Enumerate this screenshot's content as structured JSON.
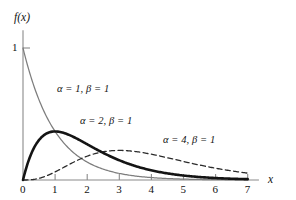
{
  "chart_data": {
    "type": "line",
    "title": "",
    "xlabel": "x",
    "ylabel": "f(x)",
    "xlim": [
      0,
      7.35
    ],
    "ylim": [
      0,
      1.12
    ],
    "xticks": [
      0,
      1,
      2,
      3,
      4,
      5,
      6,
      7
    ],
    "xtick_labels": [
      "0",
      "1",
      "2",
      "3",
      "4",
      "5",
      "6",
      "7"
    ],
    "yticks": [
      1
    ],
    "ytick_labels": [
      "1"
    ],
    "grid": false,
    "legend_position": "inline-annotations",
    "series": [
      {
        "name": "alpha = 1, beta = 1",
        "alpha": 1,
        "beta": 1,
        "style": "solid-gray",
        "color": "#7d7d7d",
        "x": [
          0,
          0.25,
          0.5,
          0.75,
          1,
          1.5,
          2,
          2.5,
          3,
          3.5,
          4,
          4.5,
          5,
          5.5,
          6,
          6.5,
          7
        ],
        "values": [
          1,
          0.779,
          0.607,
          0.472,
          0.368,
          0.223,
          0.135,
          0.082,
          0.05,
          0.03,
          0.018,
          0.011,
          0.007,
          0.004,
          0.002,
          0.002,
          0.001
        ]
      },
      {
        "name": "alpha = 2, beta = 1",
        "alpha": 2,
        "beta": 1,
        "style": "solid-thick-black",
        "color": "#141414",
        "x": [
          0,
          0.25,
          0.5,
          0.75,
          1,
          1.5,
          2,
          2.5,
          3,
          3.5,
          4,
          4.5,
          5,
          5.5,
          6,
          6.5,
          7
        ],
        "values": [
          0,
          0.195,
          0.303,
          0.354,
          0.368,
          0.335,
          0.271,
          0.205,
          0.149,
          0.106,
          0.073,
          0.05,
          0.034,
          0.022,
          0.015,
          0.01,
          0.006
        ]
      },
      {
        "name": "alpha = 4, beta = 1",
        "alpha": 4,
        "beta": 1,
        "style": "dashed",
        "color": "#2b2b2b",
        "x": [
          0,
          0.5,
          1,
          1.5,
          2,
          2.5,
          3,
          3.5,
          4,
          4.5,
          5,
          5.5,
          6,
          6.5,
          7
        ],
        "values": [
          0,
          0.0126,
          0.0613,
          0.1255,
          0.1804,
          0.2138,
          0.224,
          0.2158,
          0.1954,
          0.1687,
          0.1404,
          0.1133,
          0.0892,
          0.0688,
          0.0521
        ]
      }
    ],
    "annotations": [
      {
        "text": "α = 1, β = 1",
        "x_px": 57,
        "y_px": 84
      },
      {
        "text": "α = 2, β = 1",
        "x_px": 80,
        "y_px": 116
      },
      {
        "text": "α = 4, β = 1",
        "x_px": 163,
        "y_px": 135
      }
    ]
  },
  "axes": {
    "y_label": "f(x)",
    "x_label": "x",
    "y_tick_one": "1",
    "x_tick_0": "0",
    "x_tick_1": "1",
    "x_tick_2": "2",
    "x_tick_3": "3",
    "x_tick_4": "4",
    "x_tick_5": "5",
    "x_tick_6": "6",
    "x_tick_7": "7"
  },
  "colors": {
    "background": "#ffffff",
    "axis": "#8a8a8a",
    "text": "#111111",
    "series_a1": "#7d7d7d",
    "series_a2": "#141414",
    "series_a4": "#2b2b2b"
  }
}
